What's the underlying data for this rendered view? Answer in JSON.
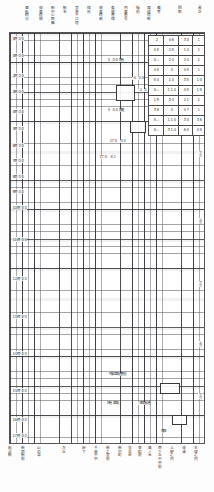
{
  "document": {
    "kind": "ruled-grid-schedule-sheet",
    "orientation": "portrait"
  },
  "header": {
    "columns": [
      {
        "label": "運転時分",
        "x": 26
      },
      {
        "label": "停車時間",
        "x": 40
      },
      {
        "label": "駅中心距離",
        "x": 52
      },
      {
        "label": "駅名",
        "x": 64
      },
      {
        "label": "営業キロ程",
        "x": 76
      },
      {
        "label": "線別",
        "x": 88
      },
      {
        "label": "発着時刻",
        "x": 100
      },
      {
        "label": "着発番線",
        "x": 112
      },
      {
        "label": "列車番号",
        "x": 124
      },
      {
        "label": "種別",
        "x": 136
      },
      {
        "label": "編成両数",
        "x": 146
      },
      {
        "label": "備考",
        "x": 156
      },
      {
        "label": "回数",
        "x": 178
      },
      {
        "label": "累計",
        "x": 198
      }
    ]
  },
  "footer": {
    "columns": [
      {
        "label": "起点駅",
        "x": 8
      },
      {
        "label": "新宿駅前",
        "x": 22
      },
      {
        "label": "山の湯",
        "x": 38
      },
      {
        "label": "方丘",
        "x": 62
      },
      {
        "label": "峠下",
        "x": 82
      },
      {
        "label": "千束中央",
        "x": 94
      },
      {
        "label": "新之宮前",
        "x": 106
      },
      {
        "label": "新中町",
        "x": 118
      },
      {
        "label": "花見台",
        "x": 128
      },
      {
        "label": "東町前",
        "x": 138
      },
      {
        "label": "高ノ台",
        "x": 148
      },
      {
        "label": "西ケ丘中央前",
        "x": 158
      },
      {
        "label": "上野之内",
        "x": 170
      },
      {
        "label": "深浦",
        "x": 182
      },
      {
        "label": "本線之内",
        "x": 194
      }
    ]
  },
  "row_labels": [
    {
      "text": "０時 ００",
      "y": 3
    },
    {
      "text": "１時 ００",
      "y": 20
    },
    {
      "text": "２時 ００",
      "y": 40
    },
    {
      "text": "３時 ００",
      "y": 56
    },
    {
      "text": "４時 ００",
      "y": 76
    },
    {
      "text": "５時 ００",
      "y": 93
    },
    {
      "text": "６時 ００",
      "y": 110
    },
    {
      "text": "７時 ００",
      "y": 125
    },
    {
      "text": "８時 ００",
      "y": 141
    },
    {
      "text": "９時 ００",
      "y": 156
    },
    {
      "text": "１０時 ００",
      "y": 172
    },
    {
      "text": "１１時 ００",
      "y": 204
    },
    {
      "text": "１２時 ００",
      "y": 243
    },
    {
      "text": "１３時 ００",
      "y": 281
    },
    {
      "text": "１４時 ００",
      "y": 318
    },
    {
      "text": "１５時 ００",
      "y": 355
    },
    {
      "text": "１６時 ００",
      "y": 384
    },
    {
      "text": "１７時 ００",
      "y": 407
    }
  ],
  "annotations": [
    {
      "text": "３．０６ 特急",
      "x": 96,
      "y": 26
    },
    {
      "text": "４．２０",
      "x": 122,
      "y": 44
    },
    {
      "text": "３．０８ 快速",
      "x": 96,
      "y": 76
    },
    {
      "text": "２７０．４０",
      "x": 98,
      "y": 107
    },
    {
      "text": "１７０．６２",
      "x": 88,
      "y": 123
    },
    {
      "text": "２．１４",
      "x": 128,
      "y": 56
    },
    {
      "text": "列車運転整理",
      "x": 98,
      "y": 340
    },
    {
      "text": "特急 運転",
      "x": 96,
      "y": 369
    },
    {
      "text": "本線直通",
      "x": 128,
      "y": 369
    },
    {
      "text": "連絡",
      "x": 150,
      "y": 397
    }
  ],
  "right_marks": [
    {
      "text": "上り",
      "y": 55
    },
    {
      "text": "下り",
      "y": 118
    },
    {
      "text": "上り",
      "y": 185
    },
    {
      "text": "下り",
      "y": 248
    },
    {
      "text": "上り",
      "y": 308
    },
    {
      "text": "下り",
      "y": 360
    }
  ],
  "num_table": {
    "left": 148,
    "top": 35,
    "col_widths": [
      14,
      14,
      13,
      11
    ],
    "row_height": 9,
    "rows": [
      [
        "２",
        "４６",
        "３０",
        "１"
      ],
      [
        "４８",
        "２８",
        "１４",
        "１"
      ],
      [
        "５―",
        "２４",
        "２４",
        "１"
      ],
      [
        "４８",
        "４",
        "４８",
        "１"
      ],
      [
        "８４",
        "１４",
        "３８",
        "１０"
      ],
      [
        "５―",
        "１１４",
        "４８",
        "１８"
      ],
      [
        "１９",
        "３４",
        "２１",
        "１"
      ],
      [
        "３６",
        "４",
        "４７",
        "１"
      ],
      [
        "８―",
        "１１４",
        "３４",
        "３６"
      ],
      [
        "８―",
        "３１４",
        "６８",
        "４８"
      ]
    ]
  },
  "boxes": [
    {
      "x": 106,
      "y": 52,
      "w": 17,
      "h": 14
    },
    {
      "x": 120,
      "y": 88,
      "w": 14,
      "h": 10
    },
    {
      "x": 150,
      "y": 350,
      "w": 18,
      "h": 9
    },
    {
      "x": 162,
      "y": 382,
      "w": 13,
      "h": 8
    }
  ]
}
